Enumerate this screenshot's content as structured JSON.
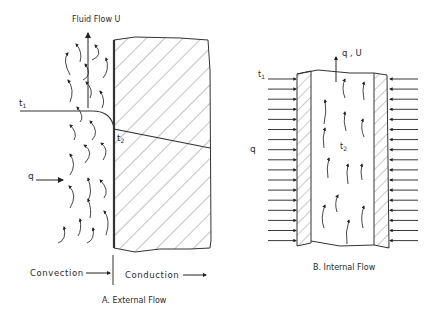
{
  "panel_a": {
    "flow_label": "Fluid Flow U",
    "t1_label": "t",
    "t1_sub": "1",
    "t2_label": "t",
    "t2_sub": "2",
    "q_label": "q",
    "convection_label": "Convection",
    "conduction_label": "Conduction",
    "caption": "A. External Flow"
  },
  "panel_b": {
    "flow_label": "q , U",
    "t1_label": "t",
    "t1_sub": "1",
    "t2_label": "t",
    "t2_sub": "2",
    "q_label": "q",
    "caption": "B. Internal Flow",
    "arrow_count_per_side": 17
  },
  "colors": {
    "line": "#333333",
    "hatch": "#555555",
    "text": "#2a2a2a"
  }
}
